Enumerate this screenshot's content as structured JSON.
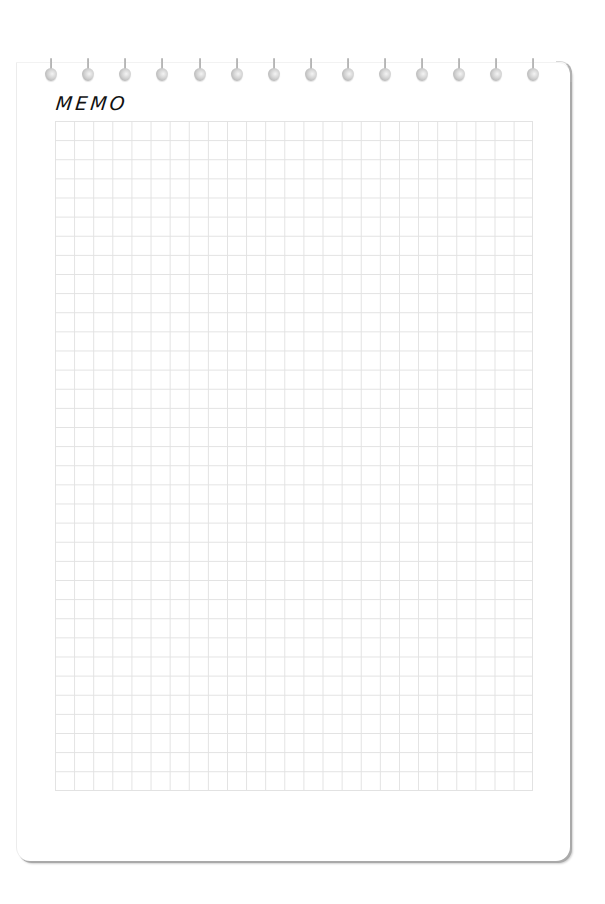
{
  "memo": {
    "title": "MEMO",
    "paper_color": "#ffffff",
    "grid_line_color": "#e2e2e2",
    "shadow_color": "#a9a9a9",
    "grid": {
      "columns": 25,
      "rows": 35
    },
    "rings": {
      "count": 14,
      "positions_x": [
        51,
        88,
        125,
        162,
        200,
        237,
        274,
        311,
        348,
        385,
        422,
        459,
        496,
        533
      ]
    }
  }
}
